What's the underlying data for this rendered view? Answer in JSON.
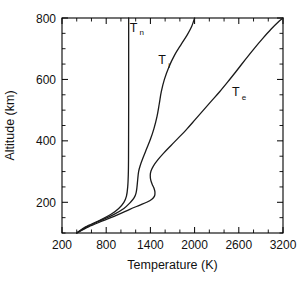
{
  "chart_data": {
    "type": "line",
    "title": "",
    "xlabel": "Temperature (K)",
    "ylabel": "Altitude (km)",
    "xlim": [
      200,
      3200
    ],
    "ylim": [
      100,
      800
    ],
    "xticks_major": [
      200,
      800,
      1400,
      2000,
      2600,
      3200
    ],
    "xtick_labels": [
      "200",
      "800",
      "1400",
      "2000",
      "2600",
      "3200"
    ],
    "xtick_minor_step": 200,
    "yticks_major": [
      200,
      400,
      600,
      800
    ],
    "ytick_labels": [
      "200",
      "400",
      "600",
      "800"
    ],
    "ytick_minor_step": 50,
    "grid": false,
    "legend_position": "inline-annotations",
    "ticks_direction": "in",
    "ticks_all_sides": true,
    "series": [
      {
        "name": "Tn",
        "label": "T",
        "subscript": "n",
        "description": "Neutral temperature",
        "label_x": 1170,
        "label_y": 755,
        "points": [
          [
            400,
            100
          ],
          [
            520,
            120
          ],
          [
            700,
            140
          ],
          [
            860,
            160
          ],
          [
            970,
            180
          ],
          [
            1040,
            200
          ],
          [
            1075,
            220
          ],
          [
            1092,
            250
          ],
          [
            1100,
            290
          ],
          [
            1103,
            340
          ],
          [
            1104,
            420
          ],
          [
            1105,
            520
          ],
          [
            1105,
            640
          ],
          [
            1105,
            800
          ]
        ]
      },
      {
        "name": "Ti",
        "label": "T",
        "subscript": "i",
        "description": "Ion temperature",
        "label_x": 1560,
        "label_y": 650,
        "points": [
          [
            400,
            100
          ],
          [
            540,
            120
          ],
          [
            720,
            140
          ],
          [
            900,
            160
          ],
          [
            1040,
            180
          ],
          [
            1130,
            200
          ],
          [
            1180,
            215
          ],
          [
            1205,
            230
          ],
          [
            1218,
            250
          ],
          [
            1228,
            275
          ],
          [
            1240,
            300
          ],
          [
            1262,
            320
          ],
          [
            1300,
            345
          ],
          [
            1350,
            375
          ],
          [
            1400,
            405
          ],
          [
            1448,
            440
          ],
          [
            1490,
            480
          ],
          [
            1520,
            520
          ],
          [
            1548,
            560
          ],
          [
            1590,
            600
          ],
          [
            1650,
            640
          ],
          [
            1730,
            680
          ],
          [
            1820,
            715
          ],
          [
            1900,
            745
          ],
          [
            1960,
            772
          ],
          [
            2000,
            800
          ]
        ]
      },
      {
        "name": "Te",
        "label": "T",
        "subscript": "e",
        "description": "Electron temperature",
        "label_x": 2560,
        "label_y": 545,
        "points": [
          [
            400,
            100
          ],
          [
            560,
            120
          ],
          [
            760,
            140
          ],
          [
            960,
            160
          ],
          [
            1120,
            177
          ],
          [
            1250,
            190
          ],
          [
            1350,
            200
          ],
          [
            1420,
            210
          ],
          [
            1455,
            220
          ],
          [
            1462,
            232
          ],
          [
            1450,
            245
          ],
          [
            1425,
            258
          ],
          [
            1405,
            272
          ],
          [
            1398,
            288
          ],
          [
            1408,
            302
          ],
          [
            1440,
            318
          ],
          [
            1500,
            338
          ],
          [
            1580,
            360
          ],
          [
            1680,
            385
          ],
          [
            1790,
            412
          ],
          [
            1900,
            440
          ],
          [
            2010,
            470
          ],
          [
            2120,
            500
          ],
          [
            2230,
            530
          ],
          [
            2340,
            560
          ],
          [
            2450,
            592
          ],
          [
            2560,
            625
          ],
          [
            2680,
            662
          ],
          [
            2800,
            698
          ],
          [
            2920,
            732
          ],
          [
            3040,
            764
          ],
          [
            3150,
            790
          ],
          [
            3200,
            800
          ]
        ]
      }
    ]
  }
}
